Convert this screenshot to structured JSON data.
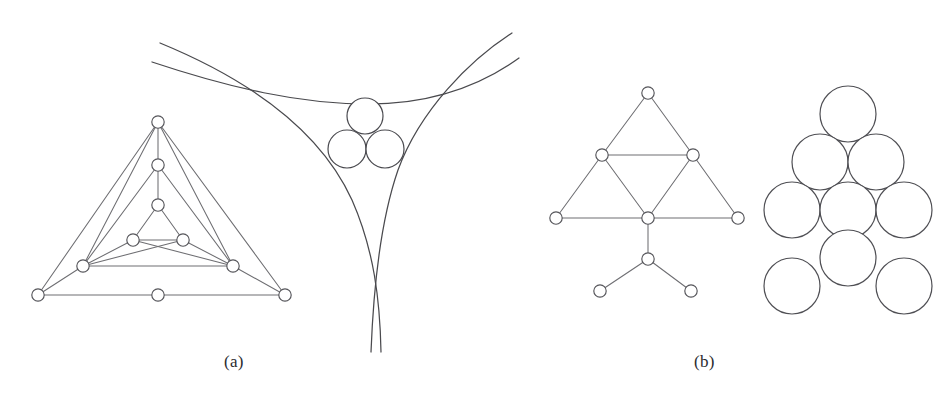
{
  "figure": {
    "background_color": "#ffffff",
    "stroke_color": "#4a4a4e",
    "node_fill": "#ffffff",
    "width": 933,
    "height": 400
  },
  "captions": [
    {
      "id": "a",
      "label": "(a)",
      "x": 224,
      "y": 352
    },
    {
      "id": "b",
      "label": "(b)",
      "x": 694,
      "y": 352
    }
  ],
  "chart_data": {
    "type": "diagram",
    "panels": [
      {
        "id": "panel-a",
        "label": "(a)",
        "parts": [
          {
            "id": "apollonian-graph",
            "kind": "graph",
            "description": "nested triangular tangency graph with 10 nodes",
            "node_radius": 6.2,
            "nodes": [
              {
                "id": "n0",
                "x": 158,
                "y": 122
              },
              {
                "id": "n1",
                "x": 158,
                "y": 165
              },
              {
                "id": "n2",
                "x": 158,
                "y": 205
              },
              {
                "id": "n3",
                "x": 133,
                "y": 240
              },
              {
                "id": "n4",
                "x": 183,
                "y": 240
              },
              {
                "id": "n5",
                "x": 83,
                "y": 266
              },
              {
                "id": "n6",
                "x": 233,
                "y": 266
              },
              {
                "id": "n7",
                "x": 38,
                "y": 295
              },
              {
                "id": "n8",
                "x": 285,
                "y": 295
              },
              {
                "id": "n9",
                "x": 158,
                "y": 295
              }
            ],
            "edges": [
              [
                "n0",
                "n1"
              ],
              [
                "n0",
                "n7"
              ],
              [
                "n0",
                "n8"
              ],
              [
                "n0",
                "n5"
              ],
              [
                "n0",
                "n6"
              ],
              [
                "n1",
                "n2"
              ],
              [
                "n1",
                "n5"
              ],
              [
                "n1",
                "n6"
              ],
              [
                "n2",
                "n3"
              ],
              [
                "n2",
                "n4"
              ],
              [
                "n3",
                "n4"
              ],
              [
                "n3",
                "n5"
              ],
              [
                "n3",
                "n6"
              ],
              [
                "n4",
                "n5"
              ],
              [
                "n4",
                "n6"
              ],
              [
                "n5",
                "n6"
              ],
              [
                "n5",
                "n7"
              ],
              [
                "n6",
                "n8"
              ],
              [
                "n7",
                "n8"
              ]
            ]
          },
          {
            "id": "curvilinear-triangle",
            "kind": "curved-triangle",
            "description": "three mutually tangent arcs forming a concave curvilinear triangle with three tangent circles inside",
            "circles": [
              {
                "id": "c-top",
                "cx": 365,
                "cy": 116,
                "r": 18
              },
              {
                "id": "c-left",
                "cx": 347,
                "cy": 149,
                "r": 19
              },
              {
                "id": "c-right",
                "cx": 385,
                "cy": 149,
                "r": 19
              }
            ]
          }
        ]
      },
      {
        "id": "panel-b",
        "label": "(b)",
        "parts": [
          {
            "id": "sierpinski-graph",
            "kind": "graph",
            "description": "triangular tangency graph with 9 nodes matching the circle packing",
            "node_radius": 6.2,
            "nodes": [
              {
                "id": "m0",
                "x": 648,
                "y": 93
              },
              {
                "id": "m1",
                "x": 602,
                "y": 155
              },
              {
                "id": "m2",
                "x": 693,
                "y": 155
              },
              {
                "id": "m3",
                "x": 556,
                "y": 218
              },
              {
                "id": "m4",
                "x": 648,
                "y": 218
              },
              {
                "id": "m5",
                "x": 738,
                "y": 218
              },
              {
                "id": "m6",
                "x": 648,
                "y": 259
              },
              {
                "id": "m7",
                "x": 600,
                "y": 291
              },
              {
                "id": "m8",
                "x": 691,
                "y": 291
              }
            ],
            "edges": [
              [
                "m0",
                "m1"
              ],
              [
                "m0",
                "m2"
              ],
              [
                "m1",
                "m2"
              ],
              [
                "m1",
                "m3"
              ],
              [
                "m1",
                "m4"
              ],
              [
                "m2",
                "m4"
              ],
              [
                "m2",
                "m5"
              ],
              [
                "m3",
                "m4"
              ],
              [
                "m4",
                "m5"
              ],
              [
                "m4",
                "m6"
              ],
              [
                "m6",
                "m7"
              ],
              [
                "m6",
                "m8"
              ]
            ]
          },
          {
            "id": "circle-packing",
            "kind": "packing",
            "description": "nine equal mutually tangent circles in a triangular arrangement",
            "radius": 28,
            "circles": [
              {
                "id": "p0",
                "cx": 848,
                "cy": 114
              },
              {
                "id": "p1",
                "cx": 820,
                "cy": 162
              },
              {
                "id": "p2",
                "cx": 876,
                "cy": 162
              },
              {
                "id": "p3",
                "cx": 792,
                "cy": 210
              },
              {
                "id": "p4",
                "cx": 848,
                "cy": 210
              },
              {
                "id": "p5",
                "cx": 904,
                "cy": 210
              },
              {
                "id": "p6",
                "cx": 848,
                "cy": 258
              },
              {
                "id": "p7",
                "cx": 792,
                "cy": 286
              },
              {
                "id": "p8",
                "cx": 904,
                "cy": 286
              }
            ]
          }
        ]
      }
    ]
  }
}
